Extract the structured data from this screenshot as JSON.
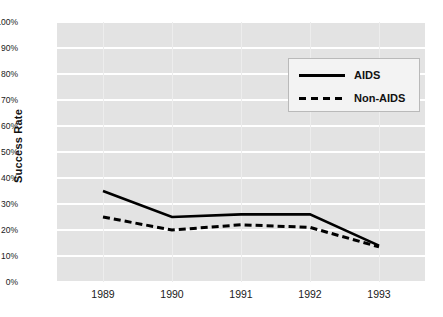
{
  "chart_data": {
    "type": "line",
    "title": "",
    "xlabel": "",
    "ylabel": "Success Rate",
    "categories": [
      "1989",
      "1990",
      "1991",
      "1992",
      "1993"
    ],
    "ylim": [
      0,
      100
    ],
    "y_tick_labels": [
      "0%",
      "10%",
      "20%",
      "30%",
      "40%",
      "50%",
      "60%",
      "70%",
      "80%",
      "90%",
      "100%"
    ],
    "y_tick_values": [
      0,
      10,
      20,
      30,
      40,
      50,
      60,
      70,
      80,
      90,
      100
    ],
    "grid": "horizontal",
    "legend_position": "upper-right",
    "series": [
      {
        "name": "AIDS",
        "style": "solid",
        "color": "#000000",
        "values": [
          35,
          25,
          26,
          26,
          14
        ]
      },
      {
        "name": "Non-AIDS",
        "style": "dashed",
        "color": "#000000",
        "values": [
          25,
          20,
          22,
          21,
          13.5
        ]
      }
    ]
  },
  "axes": {
    "y_title": "Success Rate"
  },
  "legend": {
    "entries": [
      {
        "label": "AIDS"
      },
      {
        "label": "Non-AIDS"
      }
    ]
  },
  "colors": {
    "plot_background": "#e3e3e3",
    "gridline": "#ffffff",
    "series_line": "#000000",
    "page_background": "#ffffff",
    "legend_border": "#b9b9b9",
    "text": "#1a1a1a"
  }
}
